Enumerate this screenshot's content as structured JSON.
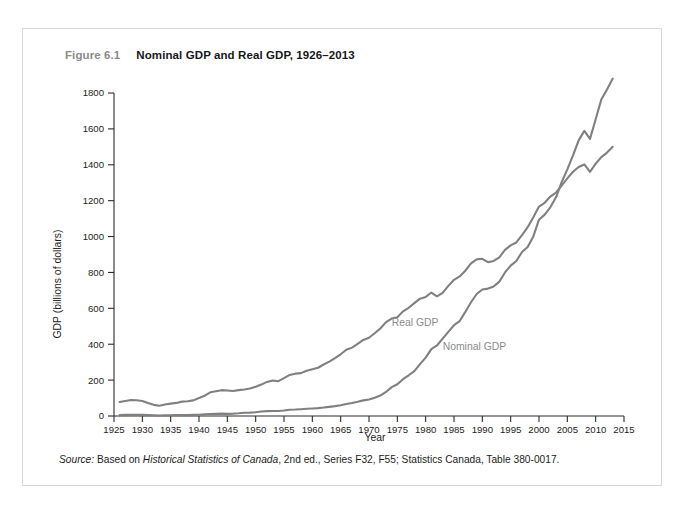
{
  "figure": {
    "number": "Figure 6.1",
    "title": "Nominal GDP and Real GDP, 1926–2013",
    "source_prefix": "Source:",
    "source_text_a": " Based on ",
    "source_italic": "Historical Statistics of Canada",
    "source_text_b": ", 2nd ed., Series F32, F55; Statistics Canada, Table 380-0017."
  },
  "colors": {
    "line": "#808080",
    "axis": "#2b2b2b",
    "text": "#1d1d20",
    "label": "#8c8c8c",
    "figure_number": "#8a8a8a",
    "border": "#d8d8d8",
    "background": "#ffffff"
  },
  "chart_data": {
    "type": "line",
    "title": "Nominal GDP and Real GDP, 1926–2013",
    "xlabel": "Year",
    "ylabel": "GDP (billions of dollars)",
    "xlim": [
      1925,
      2015
    ],
    "ylim": [
      0,
      1800
    ],
    "xticks": [
      1925,
      1930,
      1935,
      1940,
      1945,
      1950,
      1955,
      1960,
      1965,
      1970,
      1975,
      1980,
      1985,
      1990,
      1995,
      2000,
      2005,
      2010,
      2015
    ],
    "yticks": [
      0,
      200,
      400,
      600,
      800,
      1000,
      1200,
      1400,
      1600,
      1800
    ],
    "grid": false,
    "legend_position": "inline-annotation",
    "annotations": [
      {
        "text": "Real GDP",
        "x": 1974,
        "y": 500
      },
      {
        "text": "Nominal GDP",
        "x": 1983,
        "y": 370
      }
    ],
    "x": [
      1926,
      1927,
      1928,
      1929,
      1930,
      1931,
      1932,
      1933,
      1934,
      1935,
      1936,
      1937,
      1938,
      1939,
      1940,
      1941,
      1942,
      1943,
      1944,
      1945,
      1946,
      1947,
      1948,
      1949,
      1950,
      1951,
      1952,
      1953,
      1954,
      1955,
      1956,
      1957,
      1958,
      1959,
      1960,
      1961,
      1962,
      1963,
      1964,
      1965,
      1966,
      1967,
      1968,
      1969,
      1970,
      1971,
      1972,
      1973,
      1974,
      1975,
      1976,
      1977,
      1978,
      1979,
      1980,
      1981,
      1982,
      1983,
      1984,
      1985,
      1986,
      1987,
      1988,
      1989,
      1990,
      1991,
      1992,
      1993,
      1994,
      1995,
      1996,
      1997,
      1998,
      1999,
      2000,
      2001,
      2002,
      2003,
      2004,
      2005,
      2006,
      2007,
      2008,
      2009,
      2010,
      2011,
      2012,
      2013
    ],
    "series": [
      {
        "name": "Real GDP",
        "values": [
          78,
          84,
          89,
          88,
          84,
          72,
          62,
          57,
          64,
          69,
          73,
          80,
          82,
          87,
          100,
          113,
          132,
          138,
          144,
          142,
          139,
          144,
          148,
          153,
          163,
          175,
          190,
          198,
          194,
          211,
          229,
          236,
          239,
          252,
          261,
          269,
          287,
          303,
          322,
          344,
          369,
          381,
          402,
          424,
          436,
          461,
          488,
          523,
          543,
          550,
          583,
          603,
          629,
          654,
          663,
          688,
          667,
          686,
          725,
          759,
          778,
          810,
          851,
          873,
          876,
          857,
          864,
          884,
          926,
          951,
          967,
          1008,
          1052,
          1108,
          1167,
          1188,
          1223,
          1245,
          1284,
          1324,
          1361,
          1388,
          1402,
          1361,
          1406,
          1443,
          1468,
          1500
        ]
      },
      {
        "name": "Nominal GDP",
        "values": [
          5,
          6,
          6,
          6,
          6,
          5,
          4,
          3,
          4,
          4,
          5,
          5,
          5,
          6,
          7,
          9,
          11,
          12,
          13,
          12,
          13,
          15,
          18,
          19,
          21,
          25,
          27,
          28,
          28,
          31,
          35,
          36,
          38,
          40,
          42,
          44,
          47,
          51,
          55,
          60,
          67,
          72,
          79,
          87,
          92,
          102,
          114,
          134,
          161,
          177,
          205,
          227,
          250,
          289,
          325,
          373,
          393,
          431,
          469,
          506,
          529,
          580,
          634,
          680,
          705,
          710,
          722,
          749,
          800,
          838,
          864,
          914,
          942,
          1001,
          1094,
          1122,
          1163,
          1219,
          1303,
          1374,
          1452,
          1536,
          1589,
          1544,
          1654,
          1764,
          1819,
          1880
        ]
      }
    ]
  }
}
